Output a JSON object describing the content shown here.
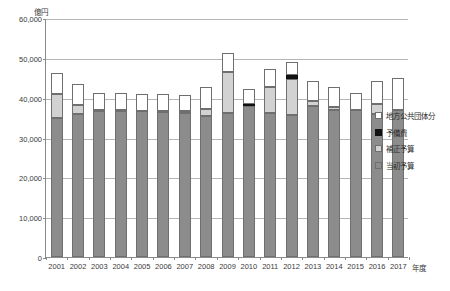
{
  "chart_data": {
    "type": "bar",
    "stacked": true,
    "title": "",
    "subtitle": "",
    "xlabel": "年度",
    "ylabel": "億円",
    "ylim": [
      0,
      60000
    ],
    "ytick_values": [
      0,
      10000,
      20000,
      30000,
      40000,
      50000,
      60000
    ],
    "ytick_labels": [
      "0",
      "10,000",
      "20,000",
      "30,000",
      "40,000",
      "50,000",
      "60,000"
    ],
    "grid": "horizontal",
    "legend_position": "right",
    "categories": [
      "2001",
      "2002",
      "2003",
      "2004",
      "2005",
      "2006",
      "2007",
      "2008",
      "2009",
      "2010",
      "2011",
      "2012",
      "2013",
      "2014",
      "2015",
      "2016",
      "2017"
    ],
    "series": [
      {
        "name": "当初予算",
        "color": "#8c8c8c",
        "values": [
          35000,
          35800,
          36600,
          36700,
          36600,
          36500,
          36200,
          35500,
          36200,
          37900,
          36200,
          35700,
          38000,
          37000,
          37000,
          36000,
          37000
        ]
      },
      {
        "name": "補正予算",
        "color": "#d2d2d2",
        "values": [
          6000,
          2400,
          200,
          100,
          100,
          100,
          500,
          1700,
          10300,
          0,
          6400,
          9100,
          1200,
          700,
          0,
          2500,
          0
        ]
      },
      {
        "name": "予備費",
        "color": "#111111",
        "values": [
          0,
          0,
          0,
          0,
          0,
          0,
          0,
          0,
          0,
          450,
          0,
          800,
          0,
          0,
          0,
          0,
          0
        ]
      },
      {
        "name": "地方公共団体分",
        "color": "#ffffff",
        "values": [
          5100,
          5300,
          4300,
          4500,
          4300,
          4400,
          4000,
          5500,
          4600,
          3950,
          4500,
          3400,
          5000,
          5100,
          4100,
          5800,
          7900
        ]
      }
    ],
    "legend": [
      {
        "label": "地方公共団体分",
        "swatch": "sw-local"
      },
      {
        "label": "予備費",
        "swatch": "sw-reserve"
      },
      {
        "label": "補正予算",
        "swatch": "sw-supp"
      },
      {
        "label": "当初予算",
        "swatch": "sw-initial"
      }
    ]
  }
}
